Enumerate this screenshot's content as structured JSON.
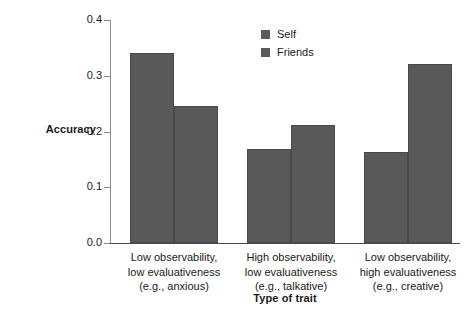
{
  "chart_data": {
    "type": "bar",
    "title": "",
    "xlabel": "Type of trait",
    "ylabel": "Accuracy",
    "categories": [
      "Low observability,\nlow evaluativeness\n(e.g., anxious)",
      "High observability,\nlow evaluativeness\n(e.g., talkative)",
      "Low observability,\nhigh evaluativeness\n(e.g., creative)"
    ],
    "series": [
      {
        "name": "Self",
        "values": [
          0.34,
          0.168,
          0.164
        ],
        "color": "#595959"
      },
      {
        "name": "Friends",
        "values": [
          0.245,
          0.212,
          0.322
        ],
        "color": "#595959"
      }
    ],
    "ylim": [
      0.0,
      0.4
    ],
    "ytick_values": [
      0.0,
      0.1,
      0.2,
      0.3,
      0.4
    ],
    "ytick_labels": [
      "0.0",
      "0.1",
      "0.2",
      "0.3",
      "0.4"
    ],
    "grid": false,
    "legend_position": "top-right-inside",
    "axis_color": "#8a8a8a",
    "background_color": "#ffffff"
  }
}
